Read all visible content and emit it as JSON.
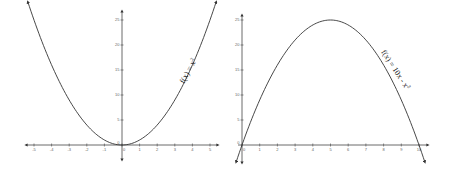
{
  "chart_data": [
    {
      "type": "line",
      "title": "",
      "function_label": "f(x) = x²",
      "xlabel": "",
      "ylabel": "",
      "xlim": [
        -5.3,
        5.3
      ],
      "ylim": [
        -1,
        27
      ],
      "x_ticks": [
        -5,
        -4,
        -3,
        -2,
        -1,
        0,
        1,
        2,
        3,
        4,
        5
      ],
      "y_ticks": [
        0,
        5,
        10,
        15,
        20,
        25
      ],
      "grid": false,
      "series": [
        {
          "name": "f(x) = x^2",
          "x": [
            -5,
            -4,
            -3,
            -2,
            -1,
            0,
            1,
            2,
            3,
            4,
            5
          ],
          "y": [
            25,
            16,
            9,
            4,
            1,
            0,
            1,
            4,
            9,
            16,
            25
          ]
        }
      ]
    },
    {
      "type": "line",
      "title": "",
      "function_label": "f(x) = 10x - x²",
      "xlabel": "",
      "ylabel": "",
      "xlim": [
        -0.3,
        10.3
      ],
      "ylim": [
        -3,
        26
      ],
      "x_ticks": [
        0,
        1,
        2,
        3,
        4,
        5,
        6,
        7,
        8,
        9,
        10
      ],
      "y_ticks": [
        0,
        5,
        10,
        15,
        20,
        25
      ],
      "grid": false,
      "series": [
        {
          "name": "f(x) = 10x - x^2",
          "x": [
            0,
            1,
            2,
            3,
            4,
            5,
            6,
            7,
            8,
            9,
            10
          ],
          "y": [
            0,
            9,
            16,
            21,
            24,
            25,
            24,
            21,
            16,
            9,
            0
          ]
        }
      ]
    }
  ],
  "left": {
    "label_f": "f(x) = x",
    "label_exp": "2",
    "xticks": [
      "-5",
      "-4",
      "-3",
      "-2",
      "-1",
      "0",
      "1",
      "2",
      "3",
      "4",
      "5"
    ],
    "yticks": [
      "5",
      "10",
      "15",
      "20",
      "25"
    ]
  },
  "right": {
    "label_f": "f(x) = 10x - x",
    "label_exp": "2",
    "xticks": [
      "0",
      "1",
      "2",
      "3",
      "4",
      "5",
      "6",
      "7",
      "8",
      "9",
      "10"
    ],
    "yticks": [
      "5",
      "10",
      "15",
      "20",
      "25"
    ]
  }
}
